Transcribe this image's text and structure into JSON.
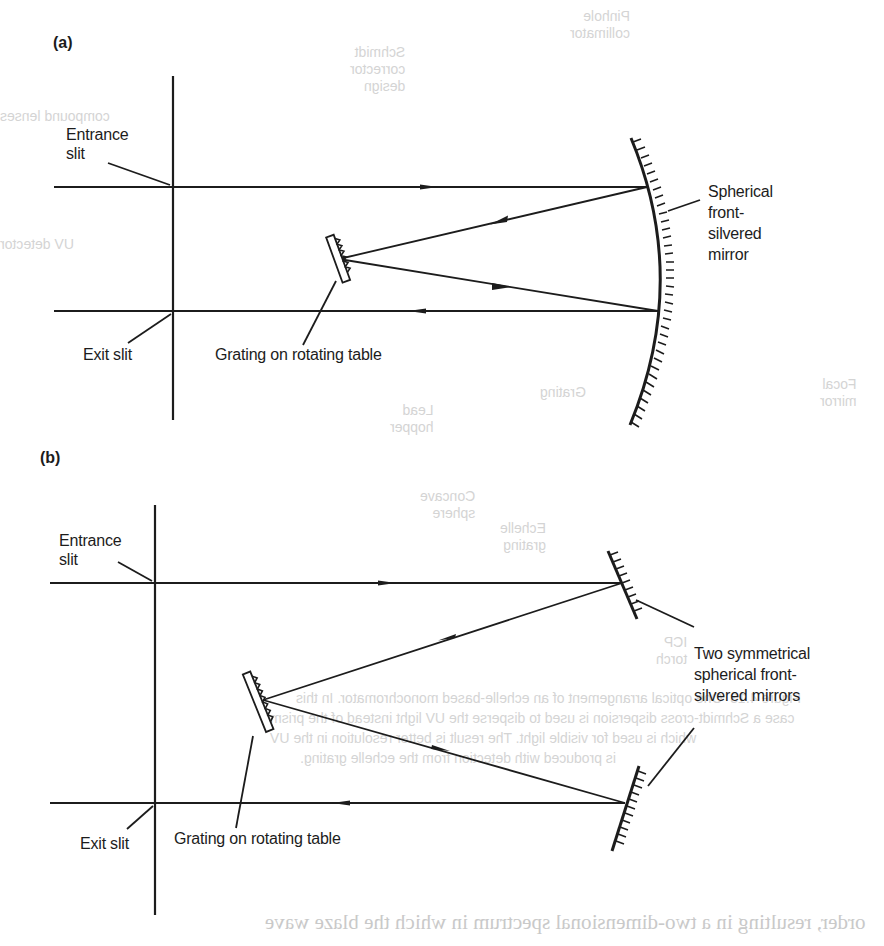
{
  "figure": {
    "ink_color": "#1c1c1c",
    "background_color": "#ffffff",
    "bleed_through_color": "#d0d0d0",
    "panels": [
      {
        "id": "a",
        "tag": "(a)",
        "labels": {
          "entrance": "Entrance\nslit",
          "exit": "Exit slit",
          "grating": "Grating on rotating table",
          "mirror": "Spherical\nfront-\nsilvered\nmirror"
        },
        "components": [
          "entrance-slit",
          "exit-slit",
          "diffraction-grating",
          "spherical-concave-mirror"
        ],
        "beam_path": [
          "entrance slit",
          "mirror",
          "grating",
          "mirror",
          "exit slit"
        ]
      },
      {
        "id": "b",
        "tag": "(b)",
        "labels": {
          "entrance": "Entrance\nslit",
          "exit": "Exit slit",
          "grating": "Grating on rotating table",
          "mirrors": "Two symmetrical\nspherical front-\nsilvered mirrors"
        },
        "components": [
          "entrance-slit",
          "exit-slit",
          "diffraction-grating",
          "upper-spherical-mirror",
          "lower-spherical-mirror"
        ],
        "beam_path": [
          "entrance slit",
          "upper mirror",
          "grating",
          "lower mirror",
          "exit slit"
        ]
      }
    ]
  },
  "bleed_through": {
    "fragments": [
      "Pinhole\ncollimator",
      "Schmidt\ncorrector\ndesign",
      "compound lenses",
      "UV detector",
      "Focal\nmirror",
      "Grating",
      "Lead\nhopper",
      "Concave\nsphere",
      "Echelle\ngrating",
      "ICP\ntorch"
    ],
    "caption_lines": [
      "Figure 4.13  One optical arrangement of an echelle-based monochromator. In this",
      "case a Schmidt-cross dispersion is used to disperse the UV light instead of the prism",
      "which is used for visible light. The result is better resolution in the UV",
      "is produced with detection from the echelle grating."
    ],
    "body_line": "order, resulting in a two-dimensional spectrum in which the blaze wave"
  }
}
